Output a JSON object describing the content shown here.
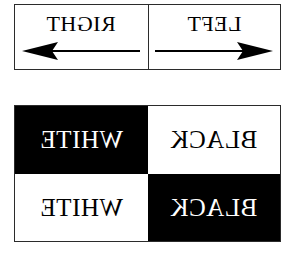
{
  "arrow_panel": {
    "cells": [
      {
        "label": "RIGHT",
        "arrow_icon": "arrow-left-icon",
        "arrow_direction": "left",
        "mirrored": true
      },
      {
        "label": "LEFT",
        "arrow_icon": "arrow-right-icon",
        "arrow_direction": "right",
        "mirrored": true
      }
    ],
    "border_color": "#2b2b2b",
    "background_color": "#ffffff",
    "text_color": "#000000"
  },
  "contrast_panel": {
    "quadrants": [
      {
        "label": "WHITE",
        "background_color": "#000000",
        "text_color": "#ffffff",
        "position": "top-left",
        "mirrored": true
      },
      {
        "label": "BLACK",
        "background_color": "#ffffff",
        "text_color": "#000000",
        "position": "top-right",
        "mirrored": true
      },
      {
        "label": "WHITE",
        "background_color": "#ffffff",
        "text_color": "#000000",
        "position": "bottom-left",
        "mirrored": true
      },
      {
        "label": "BLACK",
        "background_color": "#000000",
        "text_color": "#ffffff",
        "position": "bottom-right",
        "mirrored": true
      }
    ],
    "border_color": "#2b2b2b"
  },
  "page": {
    "background_color": "#ffffff"
  }
}
